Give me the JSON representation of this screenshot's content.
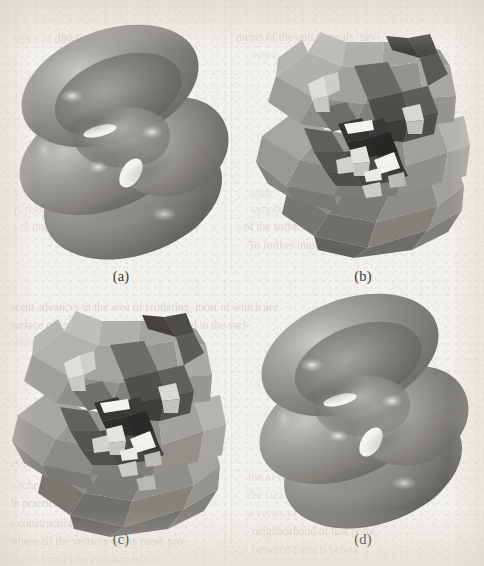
{
  "figure": {
    "background_color": "#f3f1ec",
    "panels": [
      {
        "id": "a",
        "caption": "(a)",
        "render_style": "smooth-shaded",
        "description": "Smooth Phong-shaded grey surface, limit subdivision surface"
      },
      {
        "id": "b",
        "caption": "(b)",
        "render_style": "flat-shaded-low-poly",
        "description": "Flat-shaded coarse triangular control mesh of the same surface"
      },
      {
        "id": "c",
        "caption": "(c)",
        "render_style": "flat-shaded-low-poly",
        "description": "Flat-shaded coarse triangular mesh, second variant"
      },
      {
        "id": "d",
        "caption": "(d)",
        "render_style": "smooth-shaded",
        "description": "Smooth Phong-shaded grey surface, second variant"
      }
    ],
    "surface_colors": {
      "highlight": "#e8e6e1",
      "light": "#b9b7b2",
      "mid": "#8f8d89",
      "dark": "#5e5c59",
      "darkest": "#302f2d",
      "hole": "#f7f6f2"
    },
    "ghost_text": {
      "note": "faint bleed-through text from the reverse side of the scanned page",
      "lines": [
        {
          "x": 14,
          "y": 32,
          "text": "terior of the sur-",
          "cls": "vfaint"
        },
        {
          "x": 58,
          "y": 30,
          "text": "interior of the sur-",
          "cls": "faint"
        },
        {
          "x": 236,
          "y": 30,
          "text": "ments of the unit normals. Sev-",
          "cls": "faint"
        },
        {
          "x": 252,
          "y": 47,
          "text": "sense.",
          "cls": "vfaint"
        },
        {
          "x": 14,
          "y": 186,
          "text": "y value of",
          "cls": "vfaint"
        },
        {
          "x": 14,
          "y": 202,
          "text": "is related to",
          "cls": "vfaint"
        },
        {
          "x": 12,
          "y": 219,
          "text": "s of image Q, i.e.,",
          "cls": "vfaint"
        },
        {
          "x": 250,
          "y": 186,
          "text": "same",
          "cls": "vfaint"
        },
        {
          "x": 250,
          "y": 202,
          "text": "sampling",
          "cls": "vfaint"
        },
        {
          "x": 244,
          "y": 219,
          "text": "of the surface normals",
          "cls": "faint"
        },
        {
          "x": 248,
          "y": 238,
          "text": "To further improve, pl. if",
          "cls": "faint"
        },
        {
          "x": 10,
          "y": 300,
          "text": "ecent advances in the area of rendering, most of which are",
          "cls": "faint"
        },
        {
          "x": 10,
          "y": 318,
          "text": "surface geometry, are usefully harnessed in the surf-",
          "cls": "faint"
        },
        {
          "x": 10,
          "y": 335,
          "text": "orithms based on these new structures.",
          "cls": "vfaint"
        },
        {
          "x": 14,
          "y": 420,
          "text": "and the",
          "cls": "vfaint"
        },
        {
          "x": 14,
          "y": 436,
          "text": "are all",
          "cls": "vfaint"
        },
        {
          "x": 10,
          "y": 456,
          "text": "us proportion",
          "cls": "vfaint"
        },
        {
          "x": 10,
          "y": 478,
          "text": "a scheme is well suited for",
          "cls": "faint"
        },
        {
          "x": 10,
          "y": 496,
          "text": "In practice, we find that the",
          "cls": "faint"
        },
        {
          "x": 248,
          "y": 470,
          "text": "ion of the surfaces, where",
          "cls": "vfaint"
        },
        {
          "x": 248,
          "y": 488,
          "text": "the curvature may be",
          "cls": "vfaint"
        },
        {
          "x": 248,
          "y": 506,
          "text": "a vertex of the mesh",
          "cls": "vfaint"
        },
        {
          "x": 10,
          "y": 516,
          "text": "e construction of the coarsest mesh",
          "cls": "faint"
        },
        {
          "x": 10,
          "y": 534,
          "text": "where all the vertices of the mesh pro-",
          "cls": "faint"
        },
        {
          "x": 10,
          "y": 552,
          "text": "use of a multiresolution mesh is",
          "cls": "vfaint"
        },
        {
          "x": 252,
          "y": 524,
          "text": "neighborhood of that point,",
          "cls": "faint"
        },
        {
          "x": 252,
          "y": 542,
          "text": "between them is below",
          "cls": "vfaint"
        }
      ],
      "column_rules": [
        {
          "x": 231,
          "y": 10,
          "h": 272
        },
        {
          "x": 460,
          "y": 12,
          "h": 268
        },
        {
          "x": 231,
          "y": 292,
          "h": 266
        },
        {
          "x": 460,
          "y": 292,
          "h": 266
        }
      ]
    }
  }
}
